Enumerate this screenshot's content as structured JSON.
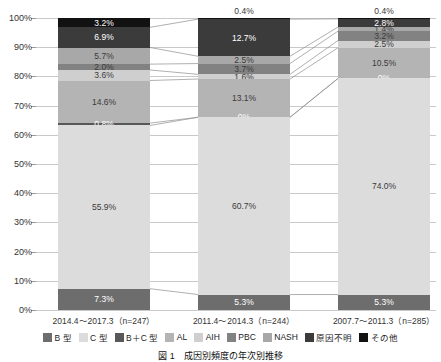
{
  "chart_data": {
    "type": "bar",
    "title": "図 1　成因別頻度の年次別推移",
    "subtype": "100% stacked bar",
    "xlabel": "",
    "ylabel": "",
    "ylim": [
      0,
      100
    ],
    "ytick_labels": [
      "0%",
      "10%",
      "20%",
      "30%",
      "40%",
      "50%",
      "60%",
      "70%",
      "80%",
      "90%",
      "100%"
    ],
    "ytick_values": [
      0,
      10,
      20,
      30,
      40,
      50,
      60,
      70,
      80,
      90,
      100
    ],
    "grid": true,
    "legend_position": "bottom",
    "categories": [
      "2014.4～2017.3（n=247）",
      "2011.4～2014.3（n=244）",
      "2007.7～2011.3（n=285）"
    ],
    "series": [
      {
        "name": "B 型",
        "color": "#6d6d6d",
        "values": [
          7.3,
          5.3,
          5.3
        ],
        "labels": [
          "7.3%",
          "5.3%",
          "5.3%"
        ]
      },
      {
        "name": "C 型",
        "color": "#dcdcdc",
        "values": [
          55.9,
          60.7,
          74.0
        ],
        "labels": [
          "55.9%",
          "60.7%",
          "74.0%"
        ]
      },
      {
        "name": "B＋C 型",
        "color": "#585858",
        "values": [
          0.8,
          0.0,
          0.0
        ],
        "labels": [
          "0.8%",
          "0%",
          "0%"
        ]
      },
      {
        "name": "AL",
        "color": "#b4b4b4",
        "values": [
          14.6,
          13.1,
          10.5
        ],
        "labels": [
          "14.6%",
          "13.1%",
          "10.5%"
        ]
      },
      {
        "name": "AIH",
        "color": "#cfcfcf",
        "values": [
          3.6,
          1.6,
          2.5
        ],
        "labels": [
          "3.6%",
          "1.6%",
          "2.5%"
        ]
      },
      {
        "name": "PBC",
        "color": "#828282",
        "values": [
          2.0,
          3.7,
          3.2
        ],
        "labels": [
          "2.0%",
          "3.7%",
          "3.2%"
        ]
      },
      {
        "name": "NASH",
        "color": "#a8a8a8",
        "values": [
          5.7,
          2.5,
          1.4
        ],
        "labels": [
          "5.7%",
          "2.5%",
          "1.4%"
        ]
      },
      {
        "name": "原因不明",
        "color": "#3b3b3b",
        "values": [
          6.9,
          12.7,
          2.8
        ],
        "labels": [
          "6.9%",
          "12.7%",
          "2.8%"
        ]
      },
      {
        "name": "その他",
        "color": "#121212",
        "values": [
          3.2,
          0.4,
          0.4
        ],
        "labels": [
          "3.2%",
          "0.4%",
          "0.4%"
        ]
      }
    ]
  },
  "axis": {
    "y_ticks": [
      {
        "label": "100%",
        "value": 100
      },
      {
        "label": "90%",
        "value": 90
      },
      {
        "label": "80%",
        "value": 80
      },
      {
        "label": "70%",
        "value": 70
      },
      {
        "label": "60%",
        "value": 60
      },
      {
        "label": "50%",
        "value": 50
      },
      {
        "label": "40%",
        "value": 40
      },
      {
        "label": "30%",
        "value": 30
      },
      {
        "label": "20%",
        "value": 20
      },
      {
        "label": "10%",
        "value": 10
      },
      {
        "label": "0%",
        "value": 0
      }
    ],
    "x_labels": [
      "2014.4～2017.3（n=247）",
      "2011.4～2014.3（n=244）",
      "2007.7～2011.3（n=285）"
    ]
  },
  "legend": {
    "items": [
      {
        "label": "B 型",
        "color": "#6d6d6d"
      },
      {
        "label": "C 型",
        "color": "#dcdcdc"
      },
      {
        "label": "B＋C 型",
        "color": "#585858"
      },
      {
        "label": "AL",
        "color": "#b4b4b4"
      },
      {
        "label": "AIH",
        "color": "#cfcfcf"
      },
      {
        "label": "PBC",
        "color": "#828282"
      },
      {
        "label": "NASH",
        "color": "#a8a8a8"
      },
      {
        "label": "原因不明",
        "color": "#3b3b3b"
      },
      {
        "label": "その他",
        "color": "#121212"
      }
    ]
  },
  "caption": {
    "text": "図 1　成因別頻度の年次別推移"
  }
}
